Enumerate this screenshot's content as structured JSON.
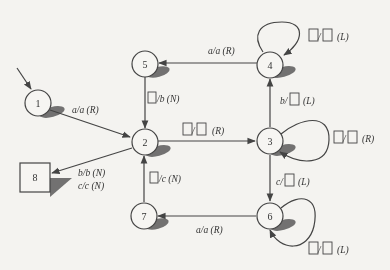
{
  "diagram": {
    "type": "state-machine",
    "colors": {
      "stroke": "#444444",
      "shadow": "#555555",
      "background": "#f4f3f0",
      "text": "#333333"
    },
    "states": [
      {
        "id": "1",
        "label": "1",
        "shape": "circle",
        "initial": true
      },
      {
        "id": "2",
        "label": "2",
        "shape": "circle"
      },
      {
        "id": "3",
        "label": "3",
        "shape": "circle"
      },
      {
        "id": "4",
        "label": "4",
        "shape": "circle"
      },
      {
        "id": "5",
        "label": "5",
        "shape": "circle"
      },
      {
        "id": "6",
        "label": "6",
        "shape": "circle"
      },
      {
        "id": "7",
        "label": "7",
        "shape": "circle"
      },
      {
        "id": "8",
        "label": "8",
        "shape": "square",
        "final": true
      }
    ],
    "transitions": [
      {
        "from": "1",
        "to": "2",
        "label": "a/a (R)"
      },
      {
        "from": "5",
        "to": "2",
        "label_blank_prefix": true,
        "label_rest": "/b (N)"
      },
      {
        "from": "4",
        "to": "5",
        "label": "a/a (R)"
      },
      {
        "from": "4",
        "to": "4",
        "label_blank_pair": true,
        "dir": "(L)"
      },
      {
        "from": "2",
        "to": "3",
        "label_blank_pair": true,
        "dir": "(R)"
      },
      {
        "from": "3",
        "to": "3",
        "label_blank_pair": true,
        "dir": "(R)"
      },
      {
        "from": "3",
        "to": "4",
        "label_prefix": "b/",
        "label_blank_suffix": true,
        "dir": "(L)"
      },
      {
        "from": "3",
        "to": "6",
        "label_prefix": "c/",
        "label_blank_suffix": true,
        "dir": "(L)"
      },
      {
        "from": "6",
        "to": "6",
        "label_blank_pair": true,
        "dir": "(L)"
      },
      {
        "from": "6",
        "to": "7",
        "label": "a/a (R)"
      },
      {
        "from": "7",
        "to": "2",
        "label_blank_prefix": true,
        "label_rest": "/c (N)"
      },
      {
        "from": "2",
        "to": "8",
        "label_lines": [
          "b/b (N)",
          "c/c (N)"
        ]
      }
    ]
  },
  "text": {
    "s1": "1",
    "s2": "2",
    "s3": "3",
    "s4": "4",
    "s5": "5",
    "s6": "6",
    "s7": "7",
    "s8": "8",
    "t_1_2": "a/a (R)",
    "t_4_5": "a/a (R)",
    "t_6_7": "a/a (R)",
    "t_5_2_rest": "/b (N)",
    "t_7_2_rest": "/c (N)",
    "t_4_4_dir": "(L)",
    "t_2_3_dir": "(R)",
    "t_3_3_dir": "(R)",
    "t_3_4_prefix": "b/",
    "t_3_4_dir": "(L)",
    "t_3_6_prefix": "c/",
    "t_3_6_dir": "(L)",
    "t_6_6_dir": "(L)",
    "t_2_8_line1": "b/b (N)",
    "t_2_8_line2": "c/c (N)",
    "slash": "/"
  }
}
